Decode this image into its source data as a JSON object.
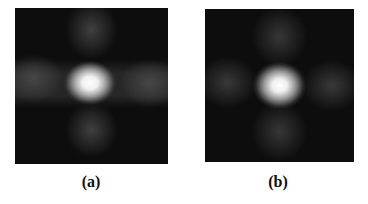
{
  "figure": {
    "panels": [
      {
        "id": "a",
        "caption": "(a)",
        "description": "Diffraction-like intensity pattern with bright central peak and four side lobes (cross shape)"
      },
      {
        "id": "b",
        "caption": "(b)",
        "description": "Similar diffraction-like intensity pattern, slightly softer central peak with dimmer side lobes"
      }
    ]
  },
  "colors": {
    "background": "#ffffff",
    "panel_background": "#0d0d0d",
    "peak": "#ffffff"
  }
}
